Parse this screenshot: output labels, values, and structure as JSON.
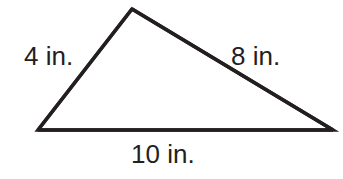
{
  "figure": {
    "type": "triangle",
    "background_color": "#ffffff",
    "stroke_color": "#231f20",
    "stroke_width": 3.5,
    "text_color": "#231f20",
    "unit": "in.",
    "vertices": {
      "apex": {
        "x": 132,
        "y": 9
      },
      "bottom_left": {
        "x": 38,
        "y": 130
      },
      "bottom_right": {
        "x": 333,
        "y": 130
      }
    },
    "sides": [
      {
        "name": "left-side",
        "label": "4 in.",
        "value": 4,
        "unit": "in.",
        "from": "bottom_left",
        "to": "apex",
        "label_position": "outside-left"
      },
      {
        "name": "right-side",
        "label": "8 in.",
        "value": 8,
        "unit": "in.",
        "from": "apex",
        "to": "bottom_right",
        "label_position": "outside-right"
      },
      {
        "name": "base-side",
        "label": "10 in.",
        "value": 10,
        "unit": "in.",
        "from": "bottom_left",
        "to": "bottom_right",
        "label_position": "below-center"
      }
    ]
  },
  "chart_data": {
    "type": "diagram",
    "title": "",
    "shape": "triangle",
    "categories": [
      "left side",
      "right side",
      "base"
    ],
    "values": [
      4,
      8,
      10
    ],
    "labels": [
      "4 in.",
      "8 in.",
      "10 in."
    ],
    "units": "inches"
  }
}
